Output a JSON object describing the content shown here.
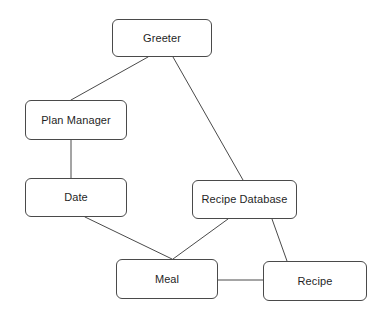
{
  "diagram": {
    "type": "node-link-diagram",
    "canvas": {
      "width": 385,
      "height": 315,
      "background": "#ffffff"
    },
    "style": {
      "node_fill": "#ffffff",
      "node_border": "#4a4a4a",
      "node_border_width": 1,
      "node_corner_radius": 6,
      "edge_color": "#4a4a4a",
      "edge_width": 1,
      "label_color": "#1f1f1f"
    },
    "nodes": [
      {
        "id": "greeter",
        "label": "Greeter",
        "x": 112,
        "y": 19,
        "w": 100,
        "h": 38
      },
      {
        "id": "plan_manager",
        "label": "Plan Manager",
        "x": 25,
        "y": 100,
        "w": 102,
        "h": 40
      },
      {
        "id": "date",
        "label": "Date",
        "x": 25,
        "y": 178,
        "w": 102,
        "h": 39
      },
      {
        "id": "recipe_database",
        "label": "Recipe Database",
        "x": 192,
        "y": 180,
        "w": 105,
        "h": 39
      },
      {
        "id": "meal",
        "label": "Meal",
        "x": 116,
        "y": 259,
        "w": 102,
        "h": 40
      },
      {
        "id": "recipe",
        "label": "Recipe",
        "x": 263,
        "y": 261,
        "w": 104,
        "h": 40
      }
    ],
    "edges": [
      {
        "id": "greeter-plan_manager",
        "from": "greeter",
        "to": "plan_manager",
        "x1": 148,
        "y1": 57,
        "x2": 71,
        "y2": 100
      },
      {
        "id": "greeter-recipe_database",
        "from": "greeter",
        "to": "recipe_database",
        "x1": 173,
        "y1": 57,
        "x2": 243,
        "y2": 180
      },
      {
        "id": "plan_manager-date",
        "from": "plan_manager",
        "to": "date",
        "x1": 71,
        "y1": 140,
        "x2": 71,
        "y2": 178
      },
      {
        "id": "date-meal",
        "from": "date",
        "to": "meal",
        "x1": 85,
        "y1": 217,
        "x2": 172,
        "y2": 259
      },
      {
        "id": "recipe_database-meal",
        "from": "recipe_database",
        "to": "meal",
        "x1": 228,
        "y1": 219,
        "x2": 173,
        "y2": 259
      },
      {
        "id": "recipe_database-recipe",
        "from": "recipe_database",
        "to": "recipe",
        "x1": 272,
        "y1": 219,
        "x2": 287,
        "y2": 261
      },
      {
        "id": "meal-recipe",
        "from": "meal",
        "to": "recipe",
        "x1": 218,
        "y1": 280,
        "x2": 263,
        "y2": 280
      }
    ]
  }
}
